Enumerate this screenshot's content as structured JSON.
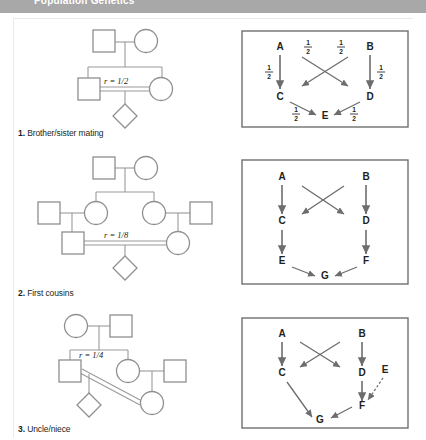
{
  "header": {
    "running_head": "Population Genetics"
  },
  "figure": {
    "panels": [
      {
        "id": "panel-1",
        "caption_number": "1.",
        "caption_text": " Brother/sister mating",
        "relatedness_label": "r = 1/2",
        "pedigree": {
          "type": "brother-sister-mating",
          "generations": 3,
          "symbols": [
            "square",
            "circle",
            "square",
            "circle",
            "diamond"
          ],
          "consanguineous_mating": true
        },
        "path_diagram": {
          "nodes": [
            "A",
            "B",
            "C",
            "D",
            "E"
          ],
          "edges": [
            {
              "from": "A",
              "to": "C",
              "label": "1/2",
              "style": "solid"
            },
            {
              "from": "A",
              "to": "D",
              "label": "1/2",
              "style": "solid"
            },
            {
              "from": "B",
              "to": "C",
              "label": "1/2",
              "style": "solid"
            },
            {
              "from": "B",
              "to": "D",
              "label": "1/2",
              "style": "solid"
            },
            {
              "from": "C",
              "to": "E",
              "label": "1/2",
              "style": "solid"
            },
            {
              "from": "D",
              "to": "E",
              "label": "1/2",
              "style": "solid"
            }
          ],
          "fraction_numerator": "1",
          "fraction_denominator": "2"
        }
      },
      {
        "id": "panel-2",
        "caption_number": "2.",
        "caption_text": " First cousins",
        "relatedness_label": "r = 1/8",
        "pedigree": {
          "type": "first-cousins",
          "generations": 4,
          "symbols": [
            "square",
            "circle",
            "square",
            "circle",
            "circle",
            "square",
            "square",
            "circle",
            "diamond"
          ],
          "consanguineous_mating": true
        },
        "path_diagram": {
          "nodes": [
            "A",
            "B",
            "C",
            "D",
            "E",
            "F",
            "G"
          ],
          "edges": [
            {
              "from": "A",
              "to": "C",
              "label": "",
              "style": "solid"
            },
            {
              "from": "A",
              "to": "D",
              "label": "",
              "style": "solid"
            },
            {
              "from": "B",
              "to": "C",
              "label": "",
              "style": "solid"
            },
            {
              "from": "B",
              "to": "D",
              "label": "",
              "style": "solid"
            },
            {
              "from": "C",
              "to": "E",
              "label": "",
              "style": "solid"
            },
            {
              "from": "D",
              "to": "F",
              "label": "",
              "style": "solid"
            },
            {
              "from": "E",
              "to": "G",
              "label": "",
              "style": "solid"
            },
            {
              "from": "F",
              "to": "G",
              "label": "",
              "style": "solid"
            }
          ]
        }
      },
      {
        "id": "panel-3",
        "caption_number": "3.",
        "caption_text": " Uncle/niece",
        "relatedness_label": "r = 1/4",
        "pedigree": {
          "type": "uncle-niece",
          "generations": 4,
          "symbols": [
            "circle",
            "square",
            "square",
            "circle",
            "square",
            "circle",
            "diamond"
          ],
          "consanguineous_mating": true
        },
        "path_diagram": {
          "nodes": [
            "A",
            "B",
            "C",
            "D",
            "E",
            "F",
            "G"
          ],
          "edges": [
            {
              "from": "A",
              "to": "C",
              "label": "",
              "style": "solid"
            },
            {
              "from": "A",
              "to": "D",
              "label": "",
              "style": "solid"
            },
            {
              "from": "B",
              "to": "C",
              "label": "",
              "style": "solid"
            },
            {
              "from": "B",
              "to": "D",
              "label": "",
              "style": "solid"
            },
            {
              "from": "D",
              "to": "F",
              "label": "",
              "style": "solid"
            },
            {
              "from": "E",
              "to": "F",
              "label": "",
              "style": "dashed"
            },
            {
              "from": "C",
              "to": "G",
              "label": "",
              "style": "solid"
            },
            {
              "from": "F",
              "to": "G",
              "label": "",
              "style": "solid"
            }
          ]
        }
      }
    ]
  },
  "colors": {
    "header_bar": "#a8a8a8",
    "pedigree_stroke": "#8f8f8f",
    "path_stroke": "#6d6d6d",
    "box_frame": "#6f6f6f",
    "text": "#231f20"
  }
}
